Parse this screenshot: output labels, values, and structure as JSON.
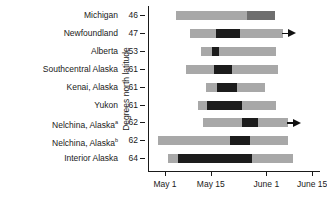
{
  "chart_data": {
    "type": "bar",
    "title": "",
    "xlabel": "",
    "ylabel": "Degrees north latitude",
    "orientation": "horizontal",
    "grid": false,
    "legend": null,
    "x_axis": {
      "ticks": [
        "May 1",
        "May 15",
        "June 1",
        "June 15"
      ],
      "tick_days": [
        0,
        14,
        31,
        45
      ],
      "range_days": [
        -2,
        48
      ]
    },
    "categories": [
      "Michigan",
      "Newfoundland",
      "Alberta",
      "Southcentral Alaska",
      "Kenai, Alaska",
      "Yukon",
      "Nelchina, Alaska",
      "Nelchina, Alaska",
      "Interior Alaska"
    ],
    "category_superscripts": [
      "",
      "",
      "",
      "",
      "",
      "",
      "a",
      "b",
      ""
    ],
    "latitudes": [
      46,
      47,
      53,
      61,
      61,
      61,
      62,
      62,
      64
    ],
    "series": [
      {
        "name": "calving period",
        "values": [
          {
            "category": "Michigan",
            "start_day": 3.5,
            "end_day": 33.5,
            "peak_start_day": 25.0,
            "peak_end_day": 33.5,
            "peak_shade": "mid",
            "open_ended": false
          },
          {
            "category": "Newfoundland",
            "start_day": 7.5,
            "end_day": 36.0,
            "peak_start_day": 15.5,
            "peak_end_day": 23.0,
            "peak_shade": "dark",
            "open_ended": true
          },
          {
            "category": "Alberta",
            "start_day": 11.0,
            "end_day": 34.0,
            "peak_start_day": 14.5,
            "peak_end_day": 16.5,
            "peak_shade": "dark",
            "open_ended": false
          },
          {
            "category": "Southcentral Alaska",
            "start_day": 6.5,
            "end_day": 34.5,
            "peak_start_day": 15.0,
            "peak_end_day": 20.5,
            "peak_shade": "dark",
            "open_ended": false
          },
          {
            "category": "Kenai, Alaska",
            "start_day": 12.5,
            "end_day": 30.5,
            "peak_start_day": 16.0,
            "peak_end_day": 22.0,
            "peak_shade": "dark",
            "open_ended": false
          },
          {
            "category": "Yukon",
            "start_day": 10.0,
            "end_day": 34.0,
            "peak_start_day": 13.0,
            "peak_end_day": 23.5,
            "peak_shade": "dark",
            "open_ended": false
          },
          {
            "category": "Nelchina, Alaska",
            "start_day": 11.5,
            "end_day": 37.5,
            "peak_start_day": 23.5,
            "peak_end_day": 28.5,
            "peak_shade": "dark",
            "open_ended": true
          },
          {
            "category": "Nelchina, Alaska",
            "start_day": -2.0,
            "end_day": 37.5,
            "peak_start_day": 20.0,
            "peak_end_day": 26.0,
            "peak_shade": "dark",
            "open_ended": false
          },
          {
            "category": "Interior Alaska",
            "start_day": 1.0,
            "end_day": 39.0,
            "peak_start_day": 4.0,
            "peak_end_day": 26.5,
            "peak_shade": "dark",
            "open_ended": false
          }
        ]
      }
    ],
    "colors": {
      "bar_light": "#a8a8a8",
      "bar_dark": "#1c1c1c",
      "bar_mid": "#6e6e6e",
      "axis": "#1a1a1a",
      "background": "#ffffff"
    }
  }
}
